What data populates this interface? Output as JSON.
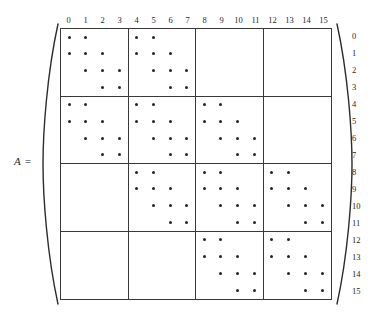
{
  "figure": {
    "label": "A =",
    "left_delimiter": "left-parenthesis",
    "right_delimiter": "right-parenthesis"
  },
  "column_headers": [
    "0",
    "1",
    "2",
    "3",
    "4",
    "5",
    "6",
    "7",
    "8",
    "9",
    "10",
    "11",
    "12",
    "13",
    "14",
    "15"
  ],
  "row_headers": [
    "0",
    "1",
    "2",
    "3",
    "4",
    "5",
    "6",
    "7",
    "8",
    "9",
    "10",
    "11",
    "12",
    "13",
    "14",
    "15"
  ],
  "chart_data": {
    "type": "heatmap",
    "title": "A =",
    "subtitle": "",
    "xlabel": "",
    "ylabel": "",
    "n_rows": 16,
    "n_cols": 16,
    "block_size": 4,
    "n_blocks": 4,
    "marker": "*",
    "marker_color": "#242424",
    "grid": true,
    "grid_color": "#3a3a3a",
    "legend": "none",
    "categories": [
      "0",
      "1",
      "2",
      "3",
      "4",
      "5",
      "6",
      "7",
      "8",
      "9",
      "10",
      "11",
      "12",
      "13",
      "14",
      "15"
    ],
    "x": [
      "0",
      "1",
      "2",
      "3",
      "4",
      "5",
      "6",
      "7",
      "8",
      "9",
      "10",
      "11",
      "12",
      "13",
      "14",
      "15"
    ],
    "block_pattern": [
      [
        1,
        1,
        0,
        0
      ],
      [
        1,
        1,
        1,
        0
      ],
      [
        0,
        1,
        1,
        1
      ],
      [
        0,
        0,
        1,
        1
      ]
    ],
    "values": [
      [
        1,
        1,
        0,
        0,
        1,
        1,
        0,
        0,
        0,
        0,
        0,
        0,
        0,
        0,
        0,
        0
      ],
      [
        1,
        1,
        1,
        0,
        1,
        1,
        1,
        0,
        0,
        0,
        0,
        0,
        0,
        0,
        0,
        0
      ],
      [
        0,
        1,
        1,
        1,
        0,
        1,
        1,
        1,
        0,
        0,
        0,
        0,
        0,
        0,
        0,
        0
      ],
      [
        0,
        0,
        1,
        1,
        0,
        0,
        1,
        1,
        0,
        0,
        0,
        0,
        0,
        0,
        0,
        0
      ],
      [
        1,
        1,
        0,
        0,
        1,
        1,
        0,
        0,
        1,
        1,
        0,
        0,
        0,
        0,
        0,
        0
      ],
      [
        1,
        1,
        1,
        0,
        1,
        1,
        1,
        0,
        1,
        1,
        1,
        0,
        0,
        0,
        0,
        0
      ],
      [
        0,
        1,
        1,
        1,
        0,
        1,
        1,
        1,
        0,
        1,
        1,
        1,
        0,
        0,
        0,
        0
      ],
      [
        0,
        0,
        1,
        1,
        0,
        0,
        1,
        1,
        0,
        0,
        1,
        1,
        0,
        0,
        0,
        0
      ],
      [
        0,
        0,
        0,
        0,
        1,
        1,
        0,
        0,
        1,
        1,
        0,
        0,
        1,
        1,
        0,
        0
      ],
      [
        0,
        0,
        0,
        0,
        1,
        1,
        1,
        0,
        1,
        1,
        1,
        0,
        1,
        1,
        1,
        0
      ],
      [
        0,
        0,
        0,
        0,
        0,
        1,
        1,
        1,
        0,
        1,
        1,
        1,
        0,
        1,
        1,
        1
      ],
      [
        0,
        0,
        0,
        0,
        0,
        0,
        1,
        1,
        0,
        0,
        1,
        1,
        0,
        0,
        1,
        1
      ],
      [
        0,
        0,
        0,
        0,
        0,
        0,
        0,
        0,
        1,
        1,
        0,
        0,
        1,
        1,
        0,
        0
      ],
      [
        0,
        0,
        0,
        0,
        0,
        0,
        0,
        0,
        1,
        1,
        1,
        0,
        1,
        1,
        1,
        0
      ],
      [
        0,
        0,
        0,
        0,
        0,
        0,
        0,
        0,
        0,
        1,
        1,
        1,
        0,
        1,
        1,
        1
      ],
      [
        0,
        0,
        0,
        0,
        0,
        0,
        0,
        0,
        0,
        0,
        1,
        1,
        0,
        0,
        1,
        1
      ]
    ],
    "nonzero_count": 136
  }
}
